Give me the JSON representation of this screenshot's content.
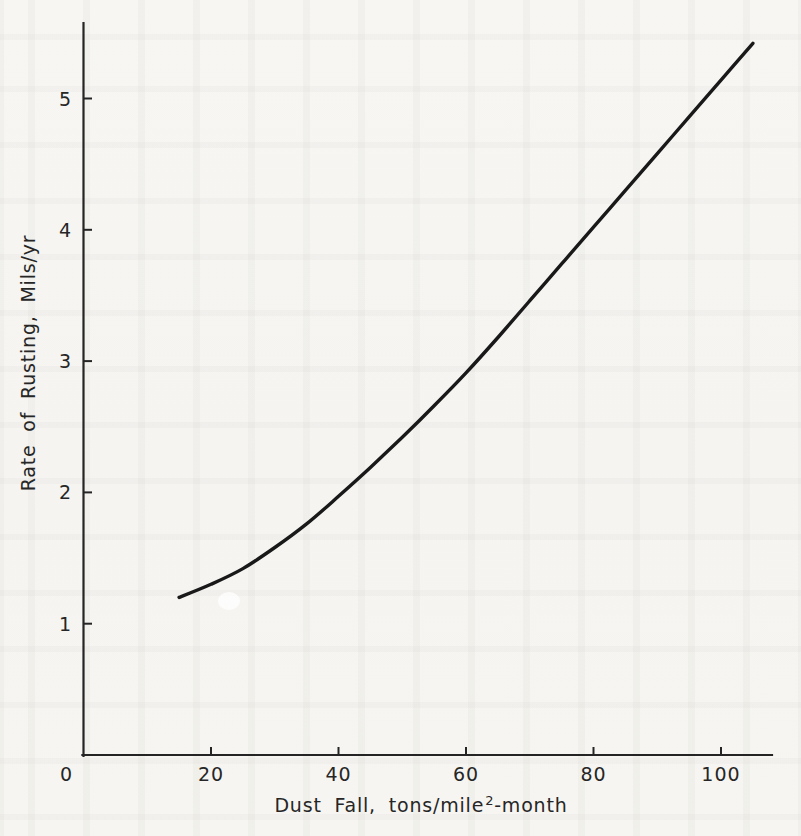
{
  "figure": {
    "paper_color": "#f6f5f2",
    "ink_color": "#191919",
    "kind": "scanned line chart"
  },
  "chart_data": {
    "type": "line",
    "title": "",
    "xlabel": "Dust Fall, tons/mile²-month",
    "xlabel_parts": {
      "prefix": "Dust Fall, tons/mile",
      "superscript": "2",
      "suffix": "-month"
    },
    "ylabel": "Rate of Rusting, Mils/yr",
    "xlim": [
      0,
      108
    ],
    "ylim": [
      0,
      5.57
    ],
    "x_ticks": [
      0,
      20,
      40,
      60,
      80,
      100
    ],
    "y_ticks": [
      1,
      2,
      3,
      4,
      5
    ],
    "grid": false,
    "legend": null,
    "series": [
      {
        "name": "rate-of-rusting",
        "x": [
          15,
          20,
          25,
          30,
          35,
          40,
          45,
          50,
          55,
          60,
          65,
          70,
          75,
          80,
          85,
          90,
          95,
          100,
          105
        ],
        "y": [
          1.2,
          1.3,
          1.42,
          1.58,
          1.76,
          1.97,
          2.19,
          2.42,
          2.66,
          2.91,
          3.18,
          3.46,
          3.74,
          4.02,
          4.3,
          4.58,
          4.86,
          5.14,
          5.42
        ]
      }
    ]
  }
}
